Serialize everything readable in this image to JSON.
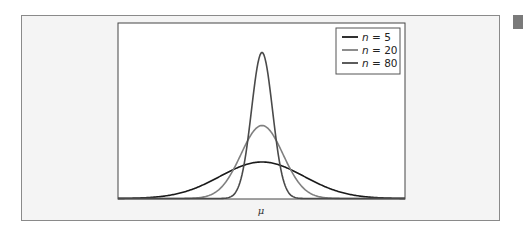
{
  "chart_data": {
    "type": "line",
    "title": "",
    "xlabel": "μ",
    "ylabel": "",
    "legend_position": "upper right",
    "grid": false,
    "x_ticks": [],
    "y_ticks": [],
    "series": [
      {
        "name": "n = 5",
        "n": 5,
        "color": "#1a1a1a",
        "relative_peak_height": 0.25,
        "relative_sd": 4.0
      },
      {
        "name": "n = 20",
        "n": 20,
        "color": "#808080",
        "relative_peak_height": 0.5,
        "relative_sd": 2.0
      },
      {
        "name": "n = 80",
        "n": 80,
        "color": "#4a4a4a",
        "relative_peak_height": 1.0,
        "relative_sd": 1.0
      }
    ]
  },
  "legend": {
    "items": [
      {
        "label_var": "n",
        "label_eq": " = 5",
        "color": "#1a1a1a"
      },
      {
        "label_var": "n",
        "label_eq": " = 20",
        "color": "#808080"
      },
      {
        "label_var": "n",
        "label_eq": " = 80",
        "color": "#4a4a4a"
      }
    ]
  },
  "axis": {
    "x_label": "μ"
  }
}
